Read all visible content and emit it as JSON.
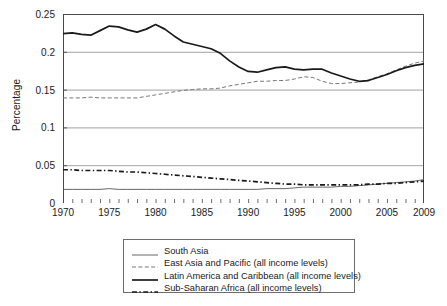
{
  "chart_data": {
    "type": "line",
    "title": "",
    "xlabel": "",
    "ylabel": "Percentage",
    "xlim": [
      1970,
      2009
    ],
    "ylim": [
      0,
      0.25
    ],
    "grid": "horizontal",
    "legend_position": "bottom",
    "x_ticks": [
      "1970",
      "1975",
      "1980",
      "1985",
      "1990",
      "1995",
      "2000",
      "2005",
      "2009"
    ],
    "x_tick_values": [
      1970,
      1975,
      1980,
      1985,
      1990,
      1995,
      2000,
      2005,
      2009
    ],
    "y_ticks": [
      "0",
      "0.05",
      "0.1",
      "0.15",
      "0.2",
      "0.25"
    ],
    "y_tick_values": [
      0,
      0.05,
      0.1,
      0.15,
      0.2,
      0.25
    ],
    "x": [
      1970,
      1971,
      1972,
      1973,
      1974,
      1975,
      1976,
      1977,
      1978,
      1979,
      1980,
      1981,
      1982,
      1983,
      1984,
      1985,
      1986,
      1987,
      1988,
      1989,
      1990,
      1991,
      1992,
      1993,
      1994,
      1995,
      1996,
      1997,
      1998,
      1999,
      2000,
      2001,
      2002,
      2003,
      2004,
      2005,
      2006,
      2007,
      2008,
      2009
    ],
    "series": [
      {
        "name": "South Asia",
        "style": "thin-solid",
        "color": "#555555",
        "values": [
          0.018,
          0.018,
          0.018,
          0.018,
          0.018,
          0.019,
          0.018,
          0.018,
          0.018,
          0.018,
          0.018,
          0.018,
          0.018,
          0.018,
          0.018,
          0.018,
          0.018,
          0.018,
          0.018,
          0.018,
          0.018,
          0.018,
          0.019,
          0.019,
          0.019,
          0.02,
          0.021,
          0.021,
          0.021,
          0.021,
          0.022,
          0.022,
          0.023,
          0.024,
          0.025,
          0.026,
          0.027,
          0.028,
          0.029,
          0.031
        ]
      },
      {
        "name": "East Asia and Pacific (all income levels)",
        "style": "light-dashed",
        "color": "#777777",
        "values": [
          0.139,
          0.139,
          0.139,
          0.14,
          0.139,
          0.139,
          0.139,
          0.139,
          0.139,
          0.141,
          0.143,
          0.145,
          0.147,
          0.149,
          0.15,
          0.151,
          0.151,
          0.152,
          0.155,
          0.157,
          0.159,
          0.161,
          0.161,
          0.162,
          0.162,
          0.164,
          0.167,
          0.166,
          0.161,
          0.158,
          0.158,
          0.159,
          0.16,
          0.163,
          0.167,
          0.171,
          0.176,
          0.181,
          0.185,
          0.188
        ]
      },
      {
        "name": "Latin America and Caribbean (all income levels)",
        "style": "thick-solid",
        "color": "#1a1a1a",
        "values": [
          0.224,
          0.225,
          0.223,
          0.222,
          0.228,
          0.234,
          0.233,
          0.229,
          0.226,
          0.23,
          0.236,
          0.23,
          0.221,
          0.213,
          0.21,
          0.207,
          0.204,
          0.198,
          0.188,
          0.18,
          0.174,
          0.173,
          0.176,
          0.179,
          0.18,
          0.177,
          0.176,
          0.177,
          0.177,
          0.172,
          0.168,
          0.164,
          0.161,
          0.162,
          0.166,
          0.17,
          0.175,
          0.179,
          0.182,
          0.184
        ]
      },
      {
        "name": "Sub-Saharan Africa (all income levels)",
        "style": "thick-dashdot",
        "color": "#1a1a1a",
        "values": [
          0.044,
          0.044,
          0.043,
          0.043,
          0.043,
          0.043,
          0.042,
          0.041,
          0.041,
          0.04,
          0.039,
          0.038,
          0.037,
          0.036,
          0.035,
          0.034,
          0.033,
          0.032,
          0.031,
          0.03,
          0.029,
          0.028,
          0.027,
          0.026,
          0.025,
          0.025,
          0.024,
          0.024,
          0.024,
          0.024,
          0.024,
          0.024,
          0.024,
          0.025,
          0.025,
          0.026,
          0.026,
          0.027,
          0.028,
          0.029
        ]
      }
    ]
  }
}
